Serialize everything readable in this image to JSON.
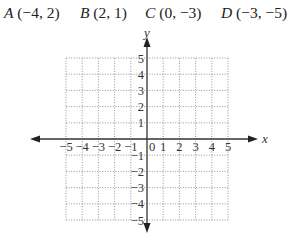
{
  "points": [
    {
      "label": "A",
      "coords": "(−4, 2)",
      "x": -4,
      "y": 2
    },
    {
      "label": "B",
      "coords": "(2, 1)",
      "x": 2,
      "y": 1
    },
    {
      "label": "C",
      "coords": "(0, −3)",
      "x": 0,
      "y": -3
    },
    {
      "label": "D",
      "coords": "(−3, −5)",
      "x": -3,
      "y": -5
    }
  ],
  "axes": {
    "x_label": "x",
    "y_label": "y"
  },
  "chart_data": {
    "type": "scatter",
    "title": "",
    "xlabel": "x",
    "ylabel": "y",
    "xlim": [
      -5,
      5
    ],
    "ylim": [
      -5,
      5
    ],
    "grid": true,
    "grid_style": "dotted",
    "x_ticks": [
      "−5",
      "−4",
      "−3",
      "−2",
      "−1",
      "0",
      "1",
      "2",
      "3",
      "4",
      "5"
    ],
    "y_ticks": [
      "5",
      "4",
      "3",
      "2",
      "1",
      "−1",
      "−2",
      "−3",
      "−4",
      "−5"
    ],
    "points_listed": [
      {
        "name": "A",
        "x": -4,
        "y": 2
      },
      {
        "name": "B",
        "x": 2,
        "y": 1
      },
      {
        "name": "C",
        "x": 0,
        "y": -3
      },
      {
        "name": "D",
        "x": -3,
        "y": -5
      }
    ],
    "points_plotted": false
  }
}
